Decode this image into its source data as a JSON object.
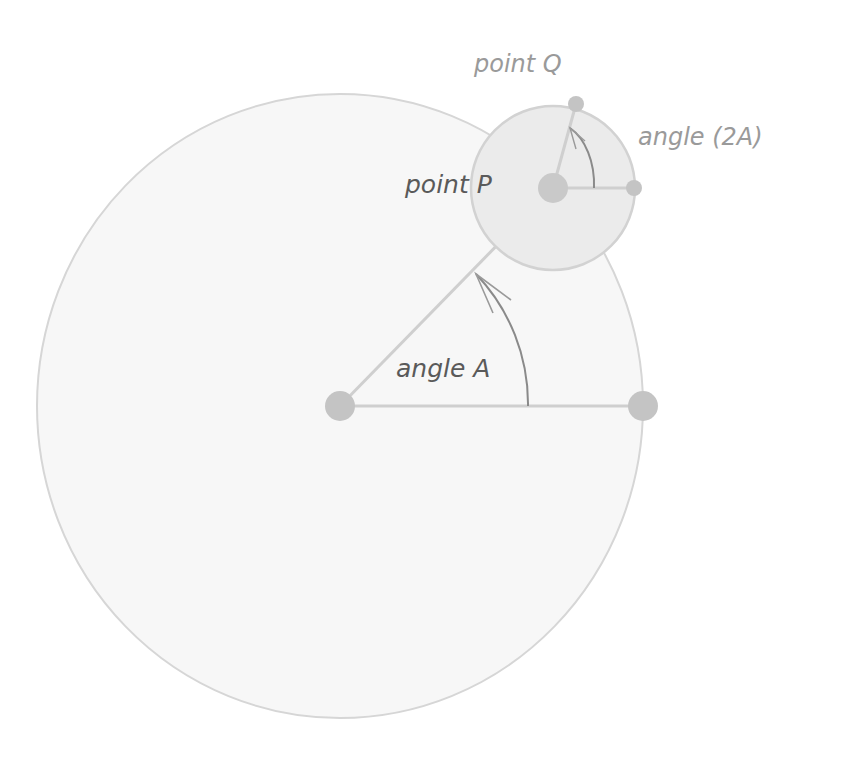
{
  "labels": {
    "point_q": "point Q",
    "angle_2a": "angle (2A)",
    "point_p": "point P",
    "angle_a": "angle A"
  },
  "colors": {
    "background": "#ffffff",
    "big_circle_fill": "#f7f7f7",
    "big_circle_stroke": "#d6d6d6",
    "small_circle_fill": "#ebebeb",
    "small_circle_stroke": "#d2d2d2",
    "radius_line": "#cfcfcf",
    "dot": "#c4c4c4",
    "arc": "#8a8a8a",
    "label_dark": "#5a5a5a",
    "label_light": "#9a9a9a"
  },
  "geometry": {
    "big_circle": {
      "cx": 340,
      "cy": 406,
      "rx": 303,
      "ry": 312
    },
    "small_circle": {
      "cx": 553,
      "cy": 188,
      "r": 82
    },
    "points": {
      "center": {
        "x": 340,
        "y": 406,
        "r": 15
      },
      "big_edge": {
        "x": 643,
        "y": 406,
        "r": 15
      },
      "p": {
        "x": 553,
        "y": 188,
        "r": 15
      },
      "q": {
        "x": 576,
        "y": 104,
        "r": 8
      },
      "small_edge": {
        "x": 634,
        "y": 188,
        "r": 8
      }
    }
  }
}
